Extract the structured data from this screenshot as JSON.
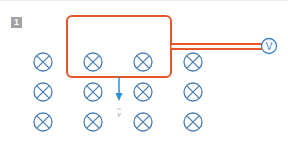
{
  "figure": {
    "number_label": "1",
    "voltmeter_label": "V",
    "velocity_label": "v",
    "colors": {
      "field_symbol": "#4a7fb5",
      "circuit_loop": "#e8552b",
      "velocity_arrow": "#2a8fd4",
      "badge_bg": "#a3a3a3",
      "voltmeter": "#3f86c4"
    },
    "field": {
      "symbol": "into-page",
      "rows": 3,
      "cols": 4,
      "x_positions": [
        43,
        93,
        143,
        193
      ],
      "y_positions": [
        62,
        92,
        122
      ]
    },
    "loop": {
      "x": 67,
      "y": 16,
      "width": 104,
      "height": 61,
      "corner_radius": 5
    }
  }
}
